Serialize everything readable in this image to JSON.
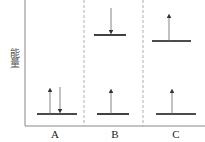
{
  "diagram": {
    "y_axis_label": "能量",
    "panels": [
      {
        "label": "A",
        "levels": [
          "ground"
        ],
        "transitions": [
          "absorption (up)",
          "emission (down)"
        ]
      },
      {
        "label": "B",
        "levels": [
          "upper",
          "ground"
        ],
        "transitions": [
          "down arrow to upper level",
          "up arrow from ground"
        ]
      },
      {
        "label": "C",
        "levels": [
          "upper",
          "ground"
        ],
        "transitions": [
          "up arrow from upper level",
          "up arrow from ground"
        ]
      }
    ],
    "colors": {
      "line": "#111111",
      "arrow": "#555555",
      "axis": "#888888",
      "divider": "#999999"
    }
  }
}
